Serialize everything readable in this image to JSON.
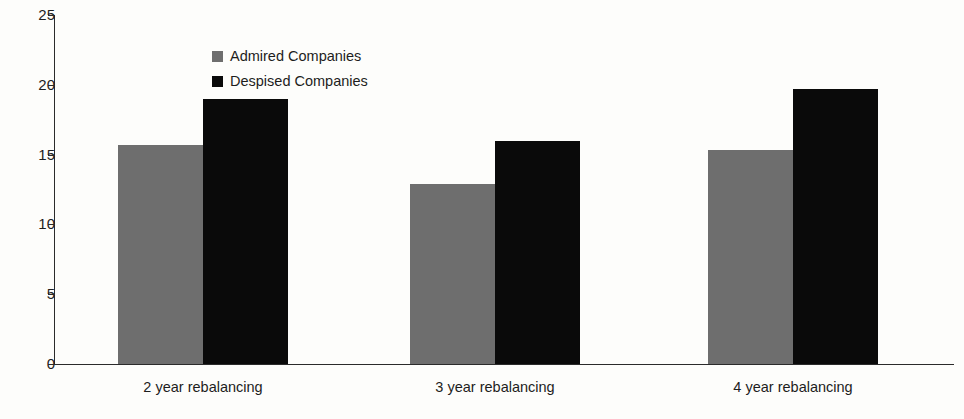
{
  "chart_data": {
    "type": "bar",
    "title": "",
    "subtitle": "",
    "xlabel": "",
    "ylabel": "",
    "categories": [
      "2 year rebalancing",
      "3 year rebalancing",
      "4 year rebalancing"
    ],
    "series": [
      {
        "name": "Admired Companies",
        "color": "#6e6e6e",
        "values": [
          15.7,
          12.9,
          15.3
        ]
      },
      {
        "name": "Despised Companies",
        "color": "#0a0a0a",
        "values": [
          19.0,
          16.0,
          19.7
        ]
      }
    ],
    "ylim": [
      0,
      25
    ],
    "yticks": [
      0,
      5,
      10,
      15,
      20,
      25
    ],
    "ytick_labels": [
      "0",
      "5",
      "10",
      "15",
      "20",
      "25"
    ],
    "grid": false,
    "legend_position": "upper-left-inside",
    "annotations": []
  },
  "legend": {
    "items": [
      {
        "label": "Admired Companies",
        "swatch": "admired"
      },
      {
        "label": "Despised Companies",
        "swatch": "despised"
      }
    ]
  },
  "axes": {
    "y": {
      "ticks": [
        {
          "label": "25",
          "value": 25
        },
        {
          "label": "20",
          "value": 20
        },
        {
          "label": "15",
          "value": 15
        },
        {
          "label": "10",
          "value": 10
        },
        {
          "label": "5",
          "value": 5
        },
        {
          "label": "0",
          "value": 0
        }
      ]
    },
    "x": {
      "labels": [
        "2 year rebalancing",
        "3 year rebalancing",
        "4 year rebalancing"
      ]
    }
  }
}
